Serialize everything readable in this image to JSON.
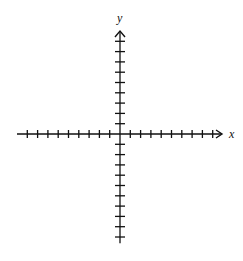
{
  "diagram": {
    "type": "cartesian-axes",
    "x_axis": {
      "label": "x",
      "ticks_left": 9,
      "ticks_right": 9,
      "arrow": "right"
    },
    "y_axis": {
      "label": "y",
      "ticks_up": 9,
      "ticks_down": 10,
      "arrow": "up"
    },
    "origin_px": [
      120,
      134
    ],
    "tick_spacing_px": 10.3,
    "stroke_color": "#111111",
    "background": "#ffffff"
  }
}
